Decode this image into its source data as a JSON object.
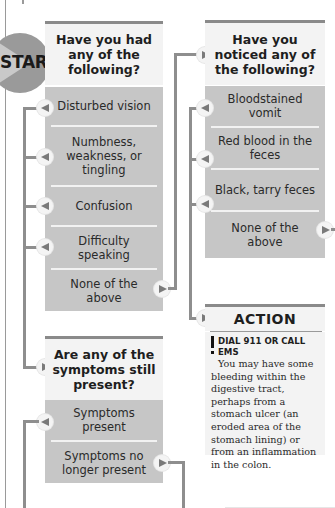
{
  "start": {
    "label": "START"
  },
  "question1": {
    "title": "Have you had any of the following?",
    "options": [
      {
        "label": "Disturbed vision"
      },
      {
        "label": "Numbness, weakness, or tingling"
      },
      {
        "label": "Confusion"
      },
      {
        "label": "Difficulty speaking"
      },
      {
        "label": "None of the above"
      }
    ]
  },
  "question2": {
    "title": "Have you noticed any of the following?",
    "options": [
      {
        "label": "Bloodstained vomit"
      },
      {
        "label": "Red blood in the feces"
      },
      {
        "label": "Black, tarry feces"
      },
      {
        "label": "None of the above"
      }
    ]
  },
  "question3": {
    "title": "Are any of the symptoms still present?",
    "options": [
      {
        "label": "Symptoms present"
      },
      {
        "label": "Symptoms no longer present"
      }
    ]
  },
  "action": {
    "title": "ACTION",
    "alert": "DIAL 911 OR CALL EMS",
    "text": "You may have some bleeding within the digestive tract, perhaps from a stomach ulcer (an eroded area of the stomach lining) or from an inflammation in the colon."
  },
  "colors": {
    "header_bg": "#f3f3f3",
    "option_bg": "#c6c6c6",
    "connector": "#8e8e8e",
    "start_circle": "#9a9a9a"
  }
}
